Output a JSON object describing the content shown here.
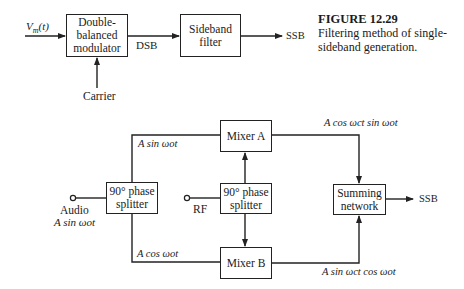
{
  "caption": {
    "figure_number": "FIGURE 12.29",
    "text": "Filtering method of single-sideband generation."
  },
  "top_diagram": {
    "input_label_base": "V",
    "input_label_sub": "m",
    "input_label_arg": "(t)",
    "modulator_box": "Double-balanced modulator",
    "dsb_label": "DSB",
    "filter_box": "Sideband filter",
    "output_label": "SSB",
    "carrier_label": "Carrier"
  },
  "bottom_diagram": {
    "audio_label": "Audio",
    "audio_signal": "A sin ωot",
    "left_splitter_box": "90° phase splitter",
    "upper_branch_label": "A sin ωot",
    "lower_branch_label": "A cos ωot",
    "rf_label": "RF",
    "center_splitter_box": "90° phase splitter",
    "mixer_a_box": "Mixer A",
    "mixer_b_box": "Mixer B",
    "mixer_a_output": "A cos ωct sin ωot",
    "mixer_b_output": "A sin ωct cos ωot",
    "summing_box": "Summing network",
    "output_label": "SSB"
  },
  "colors": {
    "line": "#222222",
    "background": "#ffffff"
  }
}
